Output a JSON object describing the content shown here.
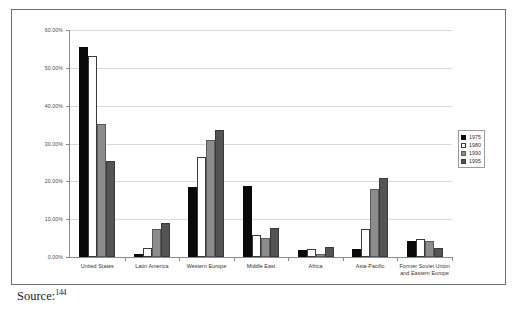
{
  "figure": {
    "source_label": "Source:",
    "source_footnote": "144"
  },
  "legend": {
    "position": "right",
    "entries": [
      {
        "label": "1975",
        "swatch": "black-swatch"
      },
      {
        "label": "1980",
        "swatch": "white-swatch"
      },
      {
        "label": "1990",
        "swatch": "gray-swatch"
      },
      {
        "label": "1995",
        "swatch": "dark-gray-swatch"
      }
    ]
  },
  "axis": {
    "y_ticks": [
      "0.00%",
      "10.00%",
      "20.00%",
      "30.00%",
      "40.00%",
      "50.00%",
      "60.00%"
    ]
  },
  "chart_data": {
    "type": "bar",
    "title": "",
    "xlabel": "",
    "ylabel": "",
    "ylim": [
      0,
      60
    ],
    "ytick_values": [
      0,
      10,
      20,
      30,
      40,
      50,
      60
    ],
    "ytick_format": "percent",
    "grid": true,
    "legend_position": "right",
    "categories": [
      "United States",
      "Latin America",
      "Western Europe",
      "Middle East",
      "Africa",
      "Asia-Pacific",
      "Former Soviet Union and Eastern Europe"
    ],
    "series": [
      {
        "name": "1975",
        "color": "#0a0a0a",
        "values": [
          55.5,
          0.8,
          18.5,
          18.7,
          1.8,
          2.1,
          4.2
        ]
      },
      {
        "name": "1980",
        "color": "#ffffff",
        "values": [
          53.0,
          2.3,
          26.5,
          5.7,
          2.2,
          7.3,
          4.8
        ]
      },
      {
        "name": "1990",
        "color": "#8c8c8c",
        "values": [
          35.1,
          7.3,
          31.0,
          5.1,
          0.7,
          18.0,
          4.2
        ]
      },
      {
        "name": "1995",
        "color": "#545454",
        "values": [
          25.3,
          9.1,
          33.6,
          7.7,
          2.6,
          21.0,
          2.4
        ]
      }
    ]
  }
}
